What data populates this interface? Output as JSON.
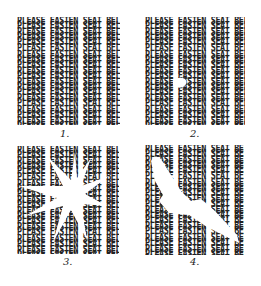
{
  "text_line": "PLEASE FASTEN SEAT BELT",
  "lines_per_panel": 23,
  "panels": [
    {
      "label": "1.",
      "description": "intact text pattern"
    },
    {
      "label": "2.",
      "description": "small white spot in center"
    },
    {
      "label": "3.",
      "description": "white starburst shape erasing text"
    },
    {
      "label": "4.",
      "description": "white diagonal streak from upper left to lower right"
    }
  ]
}
